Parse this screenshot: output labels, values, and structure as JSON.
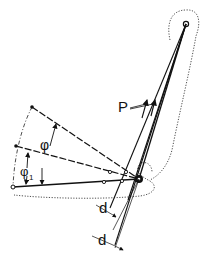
{
  "diagram": {
    "type": "mechanical lever / joint force diagram",
    "colors": {
      "ink": "#111111",
      "background": "#ffffff"
    },
    "labels": {
      "force": "P",
      "angle_main": "φ",
      "angle_sub_symbol": "φ",
      "angle_sub_index": "1",
      "lever_arm_1": "d",
      "lever_arm_2": "d"
    },
    "points": {
      "top_pivot": [
        186,
        24
      ],
      "joint": [
        139,
        179
      ],
      "upper_limb_end": [
        32,
        107
      ],
      "middle_limb_end": [
        16,
        146
      ],
      "lower_limb_end": [
        13,
        187
      ]
    }
  }
}
